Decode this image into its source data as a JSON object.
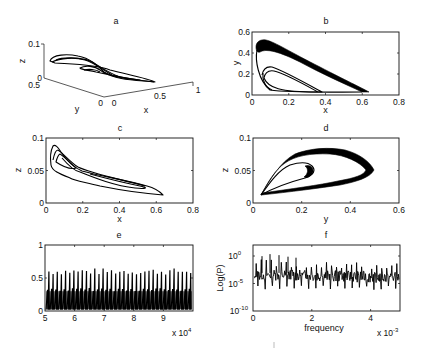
{
  "figure": {
    "panels": {
      "a": {
        "title": "a",
        "xlabel": "x",
        "ylabel": "y",
        "zlabel": "z",
        "zticks": [
          "0",
          "0.1"
        ],
        "yticks": [
          "0.5",
          "0"
        ],
        "xticks": [
          "0",
          "0.5",
          "1"
        ]
      },
      "b": {
        "title": "b",
        "xlabel": "x",
        "ylabel": "y",
        "xticks": [
          "0",
          "0.2",
          "0.4",
          "0.6",
          "0.8"
        ],
        "yticks": [
          "0",
          "0.2",
          "0.4",
          "0.6"
        ]
      },
      "c": {
        "title": "c",
        "xlabel": "x",
        "ylabel": "z",
        "xticks": [
          "0",
          "0.2",
          "0.4",
          "0.6",
          "0.8"
        ],
        "yticks": [
          "0",
          "0.05",
          "0.1"
        ]
      },
      "d": {
        "title": "d",
        "xlabel": "y",
        "ylabel": "z",
        "xticks": [
          "0",
          "0.2",
          "0.4",
          "0.6"
        ],
        "yticks": [
          "0",
          "0.05",
          "0.1"
        ]
      },
      "e": {
        "title": "e",
        "xlabel": "",
        "ylabel": "",
        "xticks": [
          "5",
          "6",
          "7",
          "8",
          "9"
        ],
        "yticks": [
          "0",
          "0.5",
          "1"
        ],
        "xscale_label": "x 10",
        "xscale_exp": "4"
      },
      "f": {
        "title": "f",
        "xlabel": "frequency",
        "ylabel": "Log(P)",
        "xticks": [
          "0",
          "2",
          "4"
        ],
        "ytick_base": "10",
        "ytick_exps": [
          "0",
          "-5",
          "-10"
        ],
        "xscale_label": "x 10",
        "xscale_exp": "-3"
      }
    }
  },
  "chart_data": [
    {
      "panel": "a",
      "type": "line",
      "title": "a",
      "description": "3D phase-space attractor (x, y, z)",
      "xlabel": "x",
      "ylabel": "y",
      "zlabel": "z",
      "xlim": [
        0,
        1
      ],
      "ylim": [
        0,
        0.5
      ],
      "zlim": [
        0,
        0.1
      ]
    },
    {
      "panel": "b",
      "type": "line",
      "title": "b",
      "xlabel": "x",
      "ylabel": "y",
      "xlim": [
        0,
        0.8
      ],
      "ylim": [
        0,
        0.6
      ],
      "series": [
        {
          "name": "outer loop (thick band)",
          "x": [
            0.02,
            0.05,
            0.1,
            0.3,
            0.5,
            0.63,
            0.55,
            0.3,
            0.1,
            0.03,
            0.02
          ],
          "y": [
            0.4,
            0.47,
            0.46,
            0.32,
            0.16,
            0.03,
            0.03,
            0.04,
            0.1,
            0.25,
            0.4
          ]
        },
        {
          "name": "inner loop",
          "x": [
            0.03,
            0.06,
            0.1,
            0.25,
            0.39,
            0.35,
            0.15,
            0.05,
            0.03
          ],
          "y": [
            0.18,
            0.25,
            0.25,
            0.15,
            0.04,
            0.03,
            0.04,
            0.1,
            0.18
          ]
        }
      ]
    },
    {
      "panel": "c",
      "type": "line",
      "title": "c",
      "xlabel": "x",
      "ylabel": "z",
      "xlim": [
        0,
        0.8
      ],
      "ylim": [
        0,
        0.1
      ],
      "series": [
        {
          "name": "projection x-z",
          "x": [
            0.03,
            0.05,
            0.2,
            0.4,
            0.63,
            0.5,
            0.3,
            0.15,
            0.04,
            0.03
          ],
          "y": [
            0.085,
            0.08,
            0.035,
            0.025,
            0.013,
            0.015,
            0.025,
            0.04,
            0.055,
            0.085
          ]
        }
      ]
    },
    {
      "panel": "d",
      "type": "line",
      "title": "d",
      "xlabel": "y",
      "ylabel": "z",
      "xlim": [
        0,
        0.6
      ],
      "ylim": [
        0,
        0.1
      ],
      "series": [
        {
          "name": "outer loop",
          "x": [
            0.03,
            0.15,
            0.25,
            0.4,
            0.48,
            0.4,
            0.2,
            0.03
          ],
          "y": [
            0.012,
            0.07,
            0.083,
            0.075,
            0.048,
            0.03,
            0.02,
            0.012
          ]
        },
        {
          "name": "inner loop",
          "x": [
            0.03,
            0.12,
            0.2,
            0.26,
            0.22,
            0.1,
            0.03
          ],
          "y": [
            0.015,
            0.055,
            0.062,
            0.048,
            0.038,
            0.025,
            0.015
          ]
        }
      ]
    },
    {
      "panel": "e",
      "type": "line",
      "title": "e",
      "xlabel": "",
      "ylabel": "",
      "xlim": [
        50000,
        100000
      ],
      "ylim": [
        0,
        1
      ],
      "x_multiplier": "x 10^4",
      "description": "time series of x: spiky oscillation, baseline ~0.02, dense band up to ~0.35, peaks 0.55–0.65",
      "peak_range": [
        0.55,
        0.65
      ],
      "band_top": 0.35,
      "baseline": 0.02,
      "approx_peak_count": 35
    },
    {
      "panel": "f",
      "type": "line",
      "title": "f",
      "xlabel": "frequency",
      "ylabel": "Log(P)",
      "xlim": [
        0,
        0.005
      ],
      "ylim_log10": [
        -10,
        3
      ],
      "yscale": "log",
      "x_multiplier": "x 10^-3",
      "description": "power spectrum: broadband level ~10^-3 with harmonic peaks up to ~10^1"
    }
  ]
}
